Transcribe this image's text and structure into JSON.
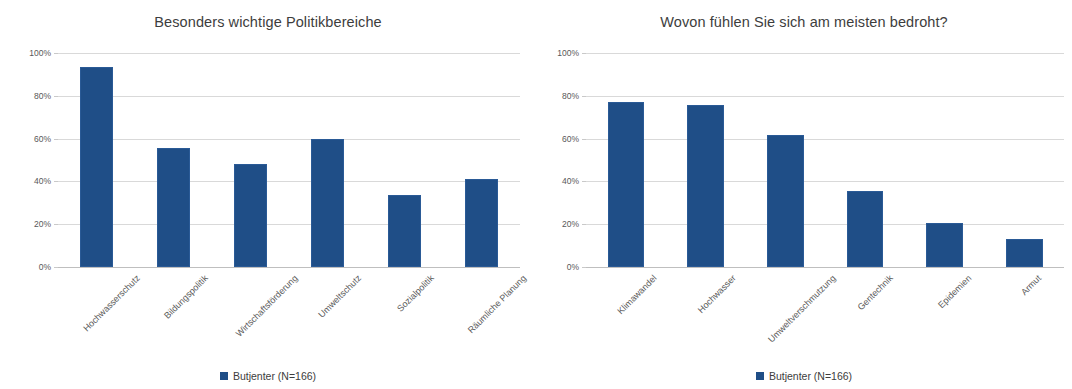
{
  "figure": {
    "background": "#ffffff",
    "bar_color": "#1F4E87",
    "grid_color": "#d9d9d9",
    "text_color": "#3d3d3d"
  },
  "charts": [
    {
      "title": "Besonders wichtige Politikbereiche",
      "legend_label": "Butjenter (N=166)",
      "yticks": [
        "0%",
        "20%",
        "40%",
        "60%",
        "80%",
        "100%"
      ]
    },
    {
      "title": "Wovon fühlen Sie sich am meisten bedroht?",
      "legend_label": "Butjenter (N=166)",
      "yticks": [
        "0%",
        "20%",
        "40%",
        "60%",
        "80%",
        "100%"
      ]
    }
  ],
  "chart_data": [
    {
      "type": "bar",
      "title": "Besonders wichtige Politikbereiche",
      "categories": [
        "Hochwasserschutz",
        "Bildungspolitik",
        "Wirtschaftsförderung",
        "Umweltschutz",
        "Sozialpolitik",
        "Räumliche Planung"
      ],
      "values": [
        93.5,
        55.5,
        48.0,
        60.0,
        33.5,
        41.0
      ],
      "series": [
        {
          "name": "Butjenter (N=166)",
          "values": [
            93.5,
            55.5,
            48.0,
            60.0,
            33.5,
            41.0
          ]
        }
      ],
      "xlabel": "",
      "ylabel": "",
      "ylim": [
        0,
        100
      ],
      "ytick_values": [
        0,
        20,
        40,
        60,
        80,
        100
      ],
      "ytick_labels": [
        "0%",
        "20%",
        "40%",
        "60%",
        "80%",
        "100%"
      ],
      "grid": true,
      "legend_position": "bottom",
      "unit": "%"
    },
    {
      "type": "bar",
      "title": "Wovon fühlen Sie sich am meisten bedroht?",
      "categories": [
        "Klimawandel",
        "Hochwasser",
        "Umweltverschmutzung",
        "Gentechnik",
        "Epidemien",
        "Armut"
      ],
      "values": [
        77.0,
        75.5,
        61.5,
        35.5,
        20.5,
        13.0
      ],
      "series": [
        {
          "name": "Butjenter (N=166)",
          "values": [
            77.0,
            75.5,
            61.5,
            35.5,
            20.5,
            13.0
          ]
        }
      ],
      "xlabel": "",
      "ylabel": "",
      "ylim": [
        0,
        100
      ],
      "ytick_values": [
        0,
        20,
        40,
        60,
        80,
        100
      ],
      "ytick_labels": [
        "0%",
        "20%",
        "40%",
        "60%",
        "80%",
        "100%"
      ],
      "grid": true,
      "legend_position": "bottom",
      "unit": "%"
    }
  ]
}
